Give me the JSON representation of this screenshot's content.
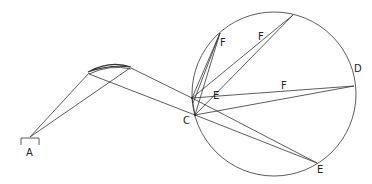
{
  "diagram": {
    "type": "optics ray diagram",
    "stroke_color": "#333333",
    "background": "#ffffff",
    "labels": {
      "A": "A",
      "C": "C",
      "D": "D",
      "E_upper": "E",
      "E_lower": "E",
      "F_upper_left": "F",
      "F_upper_mid": "F",
      "F_middle": "F"
    },
    "circle": {
      "cx": 274,
      "cy": 94,
      "r": 82
    },
    "source_A": {
      "apex": [
        30,
        137
      ]
    },
    "lens": {
      "left": [
        88,
        72
      ],
      "right": [
        131,
        67
      ]
    },
    "points": {
      "C_upper": [
        192,
        98
      ],
      "C_lower": [
        195,
        115
      ],
      "F_top_left": [
        220,
        33
      ],
      "F_top_right": [
        293,
        15
      ],
      "D": [
        354,
        86
      ],
      "E_bottom": [
        317,
        163
      ]
    }
  }
}
